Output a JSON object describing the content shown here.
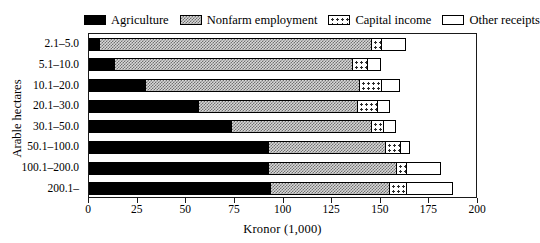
{
  "chart_data": {
    "type": "bar",
    "orientation": "horizontal",
    "stacked": true,
    "title": "",
    "xlabel": "Kronor (1,000)",
    "ylabel": "Arable hectares",
    "xlim": [
      0,
      200
    ],
    "xticks": [
      0,
      25,
      50,
      75,
      100,
      125,
      150,
      175,
      200
    ],
    "grid": false,
    "legend_position": "top",
    "categories": [
      "2.1–5.0",
      "5.1–10.0",
      "10.1–20.0",
      "20.1–30.0",
      "30.1–50.0",
      "50.1–100.0",
      "100.1–200.0",
      "200.1–"
    ],
    "series": [
      {
        "name": "Agriculture",
        "pattern": "solid-black",
        "values": [
          5,
          13,
          29,
          56,
          73,
          92,
          92,
          93
        ]
      },
      {
        "name": "Nonfarm employment",
        "pattern": "fine-checker-gray",
        "values": [
          140,
          122,
          110,
          82,
          72,
          60,
          66,
          61
        ]
      },
      {
        "name": "Capital income",
        "pattern": "dotted",
        "values": [
          5,
          8,
          11,
          10,
          6,
          8,
          5,
          9
        ]
      },
      {
        "name": "Other receipts",
        "pattern": "white",
        "values": [
          13,
          7,
          10,
          7,
          7,
          5,
          18,
          24
        ]
      }
    ],
    "totals": [
      163,
      150,
      160,
      155,
      158,
      165,
      181,
      187
    ]
  },
  "legend": {
    "items": [
      {
        "label": "Agriculture",
        "swatch": "fill-agriculture"
      },
      {
        "label": "Nonfarm employment",
        "swatch": "fill-nonfarm"
      },
      {
        "label": "Capital income",
        "swatch": "fill-capital"
      },
      {
        "label": "Other receipts",
        "swatch": "fill-other"
      }
    ]
  },
  "axes": {
    "x_title": "Kronor (1,000)",
    "y_title": "Arable hectares",
    "x_tick_labels": [
      "0",
      "25",
      "50",
      "75",
      "100",
      "125",
      "150",
      "175",
      "200"
    ],
    "y_tick_labels": [
      "2.1–5.0",
      "5.1–10.0",
      "10.1–20.0",
      "20.1–30.0",
      "30.1–50.0",
      "50.1–100.0",
      "100.1–200.0",
      "200.1–"
    ]
  },
  "colors": {
    "axis": "#1a1a1a",
    "agriculture": "#000000",
    "nonfarm": "#d8d8d8",
    "capital": "#ffffff",
    "other": "#ffffff",
    "background": "#ffffff"
  }
}
